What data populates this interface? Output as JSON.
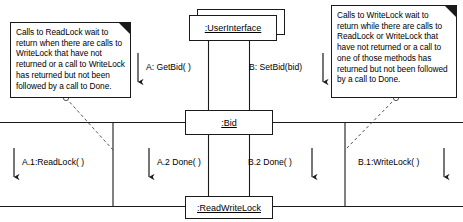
{
  "diagram": {
    "kind": "uml-communication-diagram",
    "width": 463,
    "height": 222,
    "background_color": "#ffffff",
    "line_color": "#1a1a1a",
    "text_color": "#000000"
  },
  "objects": [
    {
      "id": "userinterface",
      "label": ":UserInterface"
    },
    {
      "id": "bid",
      "label": ":Bid"
    },
    {
      "id": "readwritelock",
      "label": ":ReadWriteLock"
    }
  ],
  "messages": [
    {
      "id": "a-getbid",
      "label": "A: GetBid( )"
    },
    {
      "id": "b-setbid",
      "label": "B: SetBid(bid)"
    },
    {
      "id": "a1-readlock",
      "label": "A.1:ReadLock( )"
    },
    {
      "id": "a2-done",
      "label": "A.2 Done( )"
    },
    {
      "id": "b2-done",
      "label": "B.2 Done( )"
    },
    {
      "id": "b1-writelock",
      "label": "B.1:WriteLock( )"
    }
  ],
  "notes": [
    {
      "id": "readlock-note",
      "text": "Calls to ReadLock wait to return when there are calls to WriteLock that have not returned or a call to WriteLock has returned but not been followed by a call to Done."
    },
    {
      "id": "writelock-note",
      "text": "Calls to WriteLock wait to return while there are calls to ReadLock or WriteLock that have not returned or a call to one of those methods has returned but not been followed by a call to Done."
    }
  ]
}
